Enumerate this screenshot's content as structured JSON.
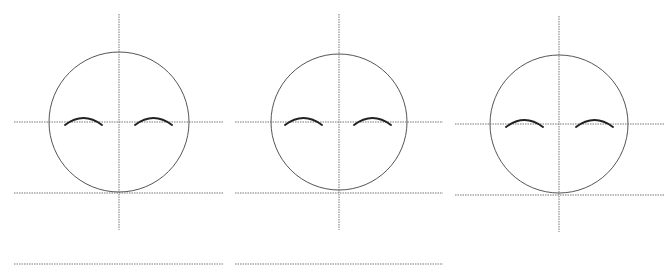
{
  "diagram": {
    "title": "",
    "colors": {
      "background": "#ffffff",
      "circle": "#555555",
      "guide": "#777777",
      "brow": "#222222"
    },
    "panels": [
      {
        "id": "face-1",
        "circle": {
          "cx": 119,
          "cy": 122,
          "r": 70
        },
        "vertical_guide": {
          "x": 119,
          "y1": 14,
          "y2": 230
        },
        "eye_guide": {
          "x1": 14,
          "x2": 223,
          "y": 122
        },
        "chin_guide": {
          "x1": 14,
          "x2": 223,
          "y": 193
        },
        "brows": [
          {
            "x1": 65,
            "x2": 102,
            "peak_y": 118,
            "base_y": 125
          },
          {
            "x1": 135,
            "x2": 172,
            "peak_y": 118,
            "base_y": 125
          }
        ]
      },
      {
        "id": "face-2",
        "circle": {
          "cx": 339,
          "cy": 122,
          "r": 68
        },
        "vertical_guide": {
          "x": 339,
          "y1": 14,
          "y2": 230
        },
        "eye_guide": {
          "x1": 235,
          "x2": 443,
          "y": 122
        },
        "chin_guide": {
          "x1": 235,
          "x2": 443,
          "y": 193
        },
        "brows": [
          {
            "x1": 285,
            "x2": 322,
            "peak_y": 118,
            "base_y": 125
          },
          {
            "x1": 354,
            "x2": 391,
            "peak_y": 118,
            "base_y": 125
          }
        ]
      },
      {
        "id": "face-3",
        "circle": {
          "cx": 559,
          "cy": 124,
          "r": 69
        },
        "vertical_guide": {
          "x": 559,
          "y1": 16,
          "y2": 232
        },
        "eye_guide": {
          "x1": 455,
          "x2": 665,
          "y": 124
        },
        "chin_guide": {
          "x1": 455,
          "x2": 665,
          "y": 195
        },
        "brows": [
          {
            "x1": 506,
            "x2": 543,
            "peak_y": 120,
            "base_y": 127
          },
          {
            "x1": 576,
            "x2": 613,
            "peak_y": 120,
            "base_y": 127
          }
        ]
      }
    ],
    "bottom_rules": [
      {
        "x1": 14,
        "x2": 223,
        "y": 264
      },
      {
        "x1": 235,
        "x2": 443,
        "y": 264
      }
    ]
  }
}
